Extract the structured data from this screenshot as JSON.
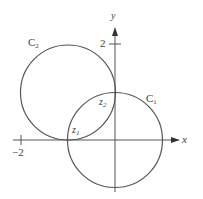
{
  "figure": {
    "type": "complex-plane circles",
    "axes": {
      "x_label": "x",
      "y_label": "y",
      "x_tick_label": "−2",
      "y_tick_label": "2",
      "x_tick_value": -2,
      "y_tick_value": 2
    },
    "circles": [
      {
        "label_main": "C",
        "label_sub": "1",
        "center": [
          0,
          0
        ],
        "radius": 1
      },
      {
        "label_main": "C",
        "label_sub": "2",
        "center": [
          -1,
          1
        ],
        "radius": 1
      }
    ],
    "points": [
      {
        "label_main": "z",
        "label_sub": "1",
        "position": [
          -1,
          0
        ]
      },
      {
        "label_main": "z",
        "label_sub": "2",
        "position": [
          0,
          1
        ]
      }
    ],
    "colors": {
      "stroke": "#555555",
      "text": "#444444",
      "background": "#ffffff"
    }
  }
}
